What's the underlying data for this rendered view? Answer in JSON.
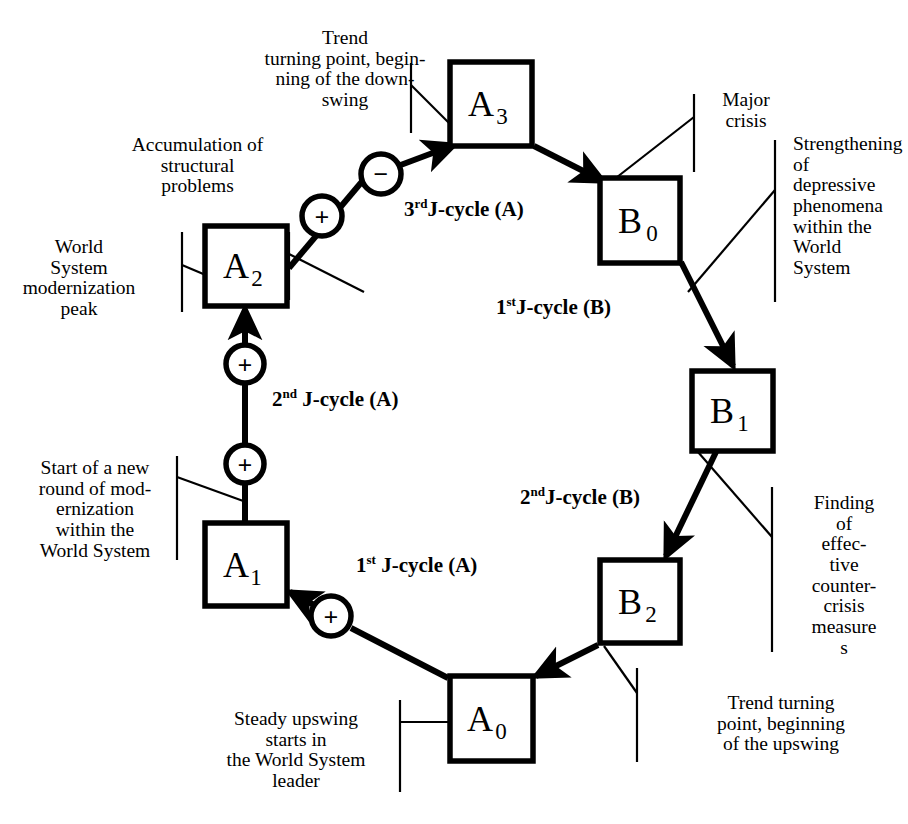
{
  "diagram": {
    "stroke_color": "#000000",
    "background_color": "#ffffff",
    "nodes": [
      {
        "id": "A3",
        "base": "A",
        "sub": "3",
        "x": 450,
        "y": 62,
        "w": 82,
        "h": 84
      },
      {
        "id": "A2",
        "base": "A",
        "sub": "2",
        "x": 205,
        "y": 226,
        "w": 82,
        "h": 80
      },
      {
        "id": "A1",
        "base": "A",
        "sub": "1",
        "x": 205,
        "y": 523,
        "w": 82,
        "h": 83
      },
      {
        "id": "A0",
        "base": "A",
        "sub": "0",
        "x": 450,
        "y": 676,
        "w": 83,
        "h": 85
      },
      {
        "id": "B0",
        "base": "B",
        "sub": "0",
        "x": 600,
        "y": 178,
        "w": 80,
        "h": 85
      },
      {
        "id": "B1",
        "base": "B",
        "sub": "1",
        "x": 692,
        "y": 371,
        "w": 81,
        "h": 80
      },
      {
        "id": "B2",
        "base": "B",
        "sub": "2",
        "x": 600,
        "y": 560,
        "w": 80,
        "h": 83
      }
    ],
    "operators": [
      {
        "id": "op-minus-a3",
        "sign": "−",
        "cx": 381,
        "cy": 174,
        "r": 20
      },
      {
        "id": "op-plus-a2",
        "sign": "+",
        "cx": 322,
        "cy": 216,
        "r": 20
      },
      {
        "id": "op-plus-a2-in",
        "sign": "+",
        "cx": 245,
        "cy": 364,
        "r": 19
      },
      {
        "id": "op-plus-a1-up",
        "sign": "+",
        "cx": 245,
        "cy": 464,
        "r": 19
      },
      {
        "id": "op-plus-a1",
        "sign": "+",
        "cx": 331,
        "cy": 616,
        "r": 20
      }
    ],
    "cycle_labels": [
      {
        "id": "cycle-3rd-a",
        "ordinal": "3",
        "suffix": "rd",
        "text": "J-cycle (A)",
        "x": 404,
        "y": 206
      },
      {
        "id": "cycle-2nd-a",
        "ordinal": "2",
        "suffix": "nd",
        "text": " J-cycle (A)",
        "x": 272,
        "y": 395
      },
      {
        "id": "cycle-1st-a",
        "ordinal": "1",
        "suffix": "st",
        "text": " J-cycle (A)",
        "x": 356,
        "y": 561
      },
      {
        "id": "cycle-1st-b",
        "ordinal": "1",
        "suffix": "st",
        "text": "J-cycle (B)",
        "x": 496,
        "y": 303
      },
      {
        "id": "cycle-2nd-b",
        "ordinal": "2",
        "suffix": "nd",
        "text": "J-cycle (B)",
        "x": 520,
        "y": 493
      }
    ],
    "annotations": [
      {
        "id": "anno-trend-downswing",
        "text": "Trend\nturning point, begin-\nning of the down-\nswing",
        "align": "center",
        "x": 225,
        "y": 28,
        "w": 240
      },
      {
        "id": "anno-accumulation",
        "text": "Accumulation of\nstructural\nproblems",
        "align": "center",
        "x": 105,
        "y": 135,
        "w": 185
      },
      {
        "id": "anno-world-system-peak",
        "text": "World\nSystem\nmodernization\npeak",
        "align": "center",
        "x": 10,
        "y": 237,
        "w": 140
      },
      {
        "id": "anno-start-new-round",
        "text": "Start of a new\nround of mod-\nernization\nwithin the\nWorld System",
        "align": "center",
        "x": 22,
        "y": 458,
        "w": 145
      },
      {
        "id": "anno-steady-upswing",
        "text": "Steady upswing\nstarts in\nthe World System\nleader",
        "align": "center",
        "x": 200,
        "y": 709,
        "w": 190
      },
      {
        "id": "anno-major-crisis",
        "text": "Major\ncrisis",
        "align": "center",
        "x": 700,
        "y": 90,
        "w": 90
      },
      {
        "id": "anno-strengthening",
        "text": "Strengthening of\ndepressive\nphenomena\nwithin the\nWorld\nSystem",
        "align": "left",
        "x": 793,
        "y": 134,
        "w": 108
      },
      {
        "id": "anno-finding-measures",
        "text": "Finding\nof\neffec-\ntive\ncounter-\ncrisis\nmeasure\ns",
        "align": "center",
        "x": 790,
        "y": 493,
        "w": 105
      },
      {
        "id": "anno-trend-upswing",
        "text": "Trend turning\npoint, beginning\nof the upswing",
        "align": "center",
        "x": 680,
        "y": 693,
        "w": 200
      }
    ],
    "leader_lines": [
      {
        "id": "leader-trend-downswing",
        "bracket": [
          [
            411,
            63
          ],
          [
            411,
            133
          ]
        ],
        "line": [
          [
            411,
            85
          ],
          [
            452,
            126
          ]
        ]
      },
      {
        "id": "leader-accumulation",
        "bracket": [
          [
            289,
            232
          ],
          [
            289,
            298
          ]
        ],
        "line": [
          [
            289,
            254
          ],
          [
            362,
            290
          ]
        ]
      },
      {
        "id": "leader-world-peak",
        "bracket": [
          [
            183,
            232
          ],
          [
            183,
            311
          ]
        ],
        "line": [
          [
            183,
            265
          ],
          [
            208,
            275
          ]
        ]
      },
      {
        "id": "leader-start-new-round",
        "bracket": [
          [
            177,
            458
          ],
          [
            177,
            560
          ]
        ],
        "line": [
          [
            177,
            477
          ],
          [
            246,
            500
          ]
        ]
      },
      {
        "id": "leader-steady-upswing",
        "bracket": [
          [
            400,
            700
          ],
          [
            400,
            790
          ]
        ],
        "line": [
          [
            400,
            722
          ],
          [
            452,
            722
          ]
        ]
      },
      {
        "id": "leader-major-crisis",
        "bracket": [
          [
            694,
            94
          ],
          [
            694,
            170
          ]
        ],
        "line": [
          [
            694,
            117
          ],
          [
            612,
            181
          ]
        ]
      },
      {
        "id": "leader-strengthening",
        "bracket": [
          [
            774,
            140
          ],
          [
            774,
            300
          ]
        ],
        "line": [
          [
            774,
            190
          ],
          [
            690,
            290
          ]
        ]
      },
      {
        "id": "leader-finding",
        "bracket": [
          [
            772,
            487
          ],
          [
            772,
            650
          ]
        ],
        "line": [
          [
            772,
            537
          ],
          [
            698,
            452
          ]
        ]
      },
      {
        "id": "leader-trend-upswing",
        "bracket": [
          [
            636,
            668
          ],
          [
            636,
            760
          ]
        ],
        "line": [
          [
            636,
            693
          ],
          [
            604,
            646
          ]
        ]
      }
    ],
    "arrows": [
      {
        "id": "arrow-a3-to-b0",
        "from": "A3",
        "to": "B0",
        "path": [
          [
            534,
            147
          ],
          [
            604,
            182
          ]
        ]
      },
      {
        "id": "arrow-b0-to-b1",
        "from": "B0",
        "to": "B1",
        "path": [
          [
            682,
            262
          ],
          [
            733,
            366
          ]
        ]
      },
      {
        "id": "arrow-b1-to-b2",
        "from": "B1",
        "to": "B2",
        "path": [
          [
            716,
            452
          ],
          [
            665,
            557
          ]
        ]
      },
      {
        "id": "arrow-b2-to-a0",
        "from": "B2",
        "to": "A0",
        "path": [
          [
            598,
            645
          ],
          [
            534,
            677
          ]
        ]
      },
      {
        "id": "arrow-a0-to-plus",
        "from": "A0",
        "to": "op-plus-a1",
        "path": [
          [
            448,
            677
          ],
          [
            350,
            625
          ]
        ]
      },
      {
        "id": "arrow-plus-to-a1",
        "from": "op-plus-a1",
        "to": "A1",
        "path": [
          [
            314,
            606
          ],
          [
            289,
            594
          ]
        ]
      },
      {
        "id": "arrow-a1-to-a2",
        "from": "A1",
        "to": "A2",
        "path": [
          [
            245,
            523
          ],
          [
            245,
            308
          ]
        ]
      },
      {
        "id": "arrow-a2-to-minus",
        "from": "A2",
        "to": "op-minus-a3",
        "path": [
          [
            288,
            266
          ],
          [
            363,
            175
          ]
        ]
      },
      {
        "id": "arrow-minus-to-a3",
        "from": "op-minus-a3",
        "to": "A3",
        "path": [
          [
            399,
            166
          ],
          [
            452,
            145
          ]
        ]
      }
    ]
  }
}
